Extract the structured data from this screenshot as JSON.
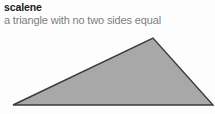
{
  "entry": {
    "headword": "scalene",
    "definition": "a triangle with no two sides equal"
  },
  "figure": {
    "name": "scalene-triangle",
    "shape": "triangle",
    "fill_color": "#a8a8a8",
    "stroke_color": "#3a3a3a",
    "stroke_width": 1.4,
    "vertices": [
      {
        "label": "bottom-left",
        "x": 13,
        "y": 105
      },
      {
        "label": "apex",
        "x": 153,
        "y": 38
      },
      {
        "label": "bottom-right",
        "x": 213,
        "y": 105
      }
    ]
  },
  "colors": {
    "background": "#fdfdfd",
    "headword_text": "#1c1c1c",
    "definition_text": "#7d7d7d",
    "figure_fill": "#a8a8a8",
    "figure_stroke": "#3a3a3a"
  }
}
